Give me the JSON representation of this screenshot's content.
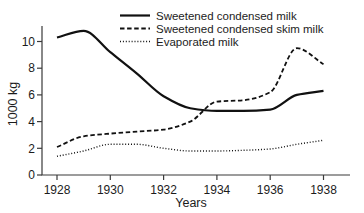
{
  "chart_data": {
    "type": "line",
    "title": "",
    "xlabel": "Years",
    "ylabel": "1000 kg",
    "x": [
      1928,
      1929,
      1930,
      1931,
      1932,
      1933,
      1934,
      1935,
      1936,
      1937,
      1938
    ],
    "x_ticks": [
      1928,
      1930,
      1932,
      1934,
      1936,
      1938
    ],
    "y_ticks": [
      0,
      2,
      4,
      6,
      8,
      10
    ],
    "xlim": [
      1928,
      1938
    ],
    "ylim": [
      0,
      11.2
    ],
    "grid": false,
    "legend_position": "top",
    "series": [
      {
        "name": "Sweetened condensed milk",
        "line_style": "solid",
        "values": [
          10.3,
          10.8,
          9.2,
          7.6,
          5.9,
          5.0,
          4.8,
          4.8,
          4.9,
          6.0,
          6.3
        ]
      },
      {
        "name": "Sweetened condensed skim milk",
        "line_style": "dashed",
        "values": [
          2.1,
          2.9,
          3.1,
          3.25,
          3.4,
          4.0,
          5.5,
          5.6,
          6.2,
          9.5,
          8.3
        ]
      },
      {
        "name": "Evaporated milk",
        "line_style": "dotted",
        "values": [
          1.4,
          1.8,
          2.3,
          2.3,
          2.0,
          1.8,
          1.8,
          1.85,
          1.95,
          2.3,
          2.6
        ]
      }
    ],
    "colors": {
      "line": "#111111",
      "text": "#1c1c1c",
      "axis": "#3a3a3a",
      "background": "#ffffff"
    }
  }
}
